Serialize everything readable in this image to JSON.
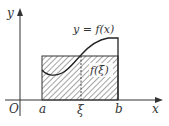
{
  "figure": {
    "type": "mean-value-theorem-integral",
    "axes": {
      "x_label": "x",
      "y_label": "y",
      "origin_label": "O"
    },
    "points": {
      "a": "a",
      "xi": "ξ",
      "b": "b"
    },
    "curve_label": "y = f(x)",
    "rect_label": "f(ξ)",
    "colors": {
      "stroke": "#333333",
      "hatch": "#555555",
      "background": "#ffffff"
    }
  }
}
